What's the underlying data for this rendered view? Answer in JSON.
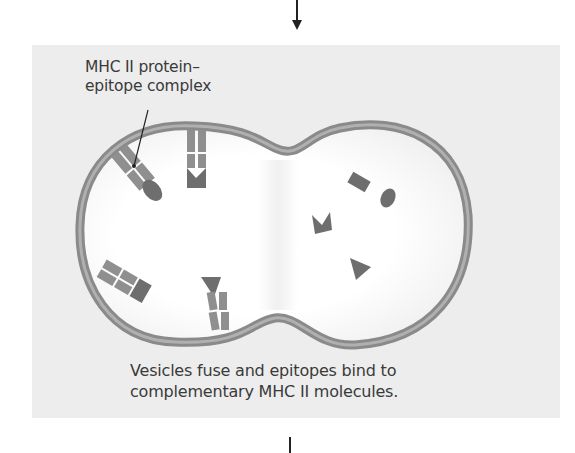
{
  "diagram": {
    "labels": {
      "complex_line1": "MHC II protein–",
      "complex_line2": "epitope complex",
      "caption_line1": "Vesicles fuse and epitopes bind to",
      "caption_line2": "complementary MHC II molecules."
    },
    "colors": {
      "panel_bg": "#ededed",
      "membrane": "#8a8a8a",
      "membrane_inner": "#a9a9a9",
      "protein": "#8f8f8f",
      "epitope": "#6e6e6e",
      "text": "#3a3a3a"
    },
    "elements": [
      {
        "type": "arrow",
        "direction": "down",
        "position": "top-center"
      },
      {
        "type": "vesicle",
        "shape": "fused-double-lobe"
      },
      {
        "type": "mhc-ii-complex",
        "count": 4,
        "location": "left lobe membrane"
      },
      {
        "type": "free-epitope",
        "shapes": [
          "rectangle",
          "ellipse",
          "notched-arrow",
          "triangle"
        ],
        "location": "right lobe"
      },
      {
        "type": "leader-line",
        "from": "label",
        "to": "mhc-ii-complex"
      },
      {
        "type": "flow-line",
        "position": "bottom-center"
      }
    ]
  }
}
